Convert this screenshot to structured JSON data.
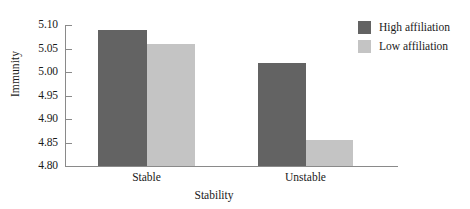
{
  "chart_data": {
    "type": "bar",
    "title": "",
    "xlabel": "Stability",
    "ylabel": "Immunity",
    "categories": [
      "Stable",
      "Unstable"
    ],
    "series": [
      {
        "name": "High affiliation",
        "values": [
          5.09,
          5.02
        ],
        "color": "#636363"
      },
      {
        "name": "Low affiliation",
        "values": [
          5.06,
          4.855
        ],
        "color": "#c4c4c4"
      }
    ],
    "ylim": [
      4.8,
      5.1
    ],
    "yticks": [
      "4.80",
      "4.85",
      "4.90",
      "4.95",
      "5.00",
      "5.05",
      "5.10"
    ],
    "ytick_values": [
      4.8,
      4.85,
      4.9,
      4.95,
      5.0,
      5.05,
      5.1
    ],
    "grid": false,
    "legend_position": "upper right"
  },
  "axes": {
    "y_title": "Immunity",
    "x_title": "Stability",
    "y_tick_labels": [
      "5.10",
      "5.05",
      "5.00",
      "4.95",
      "4.90",
      "4.85",
      "4.80"
    ],
    "x_tick_labels": [
      "Stable",
      "Unstable"
    ]
  },
  "legend": {
    "items": [
      {
        "label": "High affiliation",
        "color": "#636363"
      },
      {
        "label": "Low affiliation",
        "color": "#c4c4c4"
      }
    ]
  },
  "colors": {
    "high_affiliation": "#636363",
    "low_affiliation": "#c4c4c4",
    "axis": "#8a8a8a",
    "text": "#1a1a1a",
    "background": "#ffffff"
  }
}
